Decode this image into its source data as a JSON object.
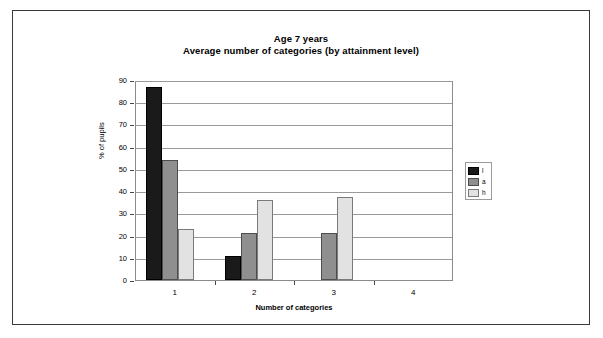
{
  "chart_data": {
    "type": "bar",
    "title": "Age 7 years",
    "subtitle": "Average number of categories (by attainment level)",
    "xlabel": "Number of categories",
    "ylabel": "% of pupils",
    "categories": [
      "1",
      "2",
      "3",
      "4"
    ],
    "ylim": [
      0,
      90
    ],
    "yticks": [
      0,
      10,
      20,
      30,
      40,
      50,
      60,
      70,
      80,
      90
    ],
    "grid": true,
    "legend_position": "right",
    "series": [
      {
        "name": "l",
        "color": "#1a1a1a",
        "values": [
          87,
          11,
          0,
          0
        ]
      },
      {
        "name": "a",
        "color": "#8f8f8f",
        "values": [
          54,
          21,
          21,
          0
        ]
      },
      {
        "name": "h",
        "color": "#e2e2e2",
        "values": [
          23,
          36,
          37.5,
          0
        ]
      }
    ]
  }
}
